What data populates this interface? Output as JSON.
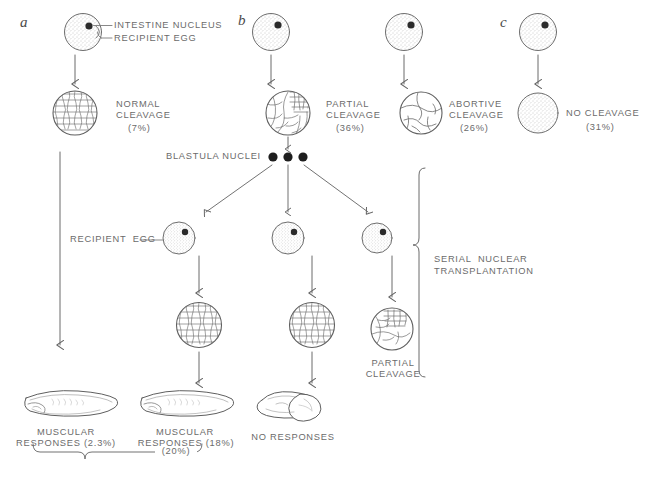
{
  "figure": {
    "background_color": "#ffffff",
    "ink_color": "#555555",
    "text_color": "#6b6b6b",
    "width": 655,
    "height": 479
  },
  "panels": [
    {
      "letter": "a"
    },
    {
      "letter": "b"
    },
    {
      "letter": "c"
    }
  ],
  "callouts": {
    "intestine_nucleus": "INTESTINE NUCLEUS",
    "recipient_egg": "RECIPIENT EGG",
    "recipient_egg_lower": "RECIPIENT  EGG",
    "blastula_nuclei": "BLASTULA NUCLEI",
    "serial_nuclear_transplantation_line1": "SERIAL  NUCLEAR",
    "serial_nuclear_transplantation_line2": "TRANSPLANTATION"
  },
  "top_outcomes": [
    {
      "id": "normal-cleavage",
      "line1": "NORMAL",
      "line2": "CLEAVAGE",
      "percent": "(7%)",
      "morphology": "blastula-fine"
    },
    {
      "id": "partial-cleavage",
      "line1": "PARTIAL",
      "line2": "CLEAVAGE",
      "percent": "(36%)",
      "morphology": "partial-blastula"
    },
    {
      "id": "abortive-cleavage",
      "line1": "ABORTIVE",
      "line2": "CLEAVAGE",
      "percent": "(26%)",
      "morphology": "abortive"
    },
    {
      "id": "no-cleavage",
      "line1": "NO CLEAVAGE",
      "line2": "",
      "percent": "(31%)",
      "morphology": "uncleaved-egg"
    }
  ],
  "serial_branch_outcomes": [
    {
      "id": "branch-left",
      "label_line1": "",
      "label_line2": "",
      "morphology": "blastula-fine"
    },
    {
      "id": "branch-middle",
      "label_line1": "",
      "label_line2": "",
      "morphology": "blastula-fine"
    },
    {
      "id": "branch-right",
      "label_line1": "PARTIAL",
      "label_line2": "CLEAVAGE",
      "morphology": "partial-blastula"
    }
  ],
  "bottom_results": [
    {
      "id": "result-left",
      "line1": "MUSCULAR",
      "line2": "RESPONSES (2.3%)",
      "morphology": "tadpole"
    },
    {
      "id": "result-middle",
      "line1": "MUSCULAR",
      "line2": "RESPONSES (18%)",
      "morphology": "tadpole"
    },
    {
      "id": "result-right",
      "line1": "NO RESPONSES",
      "line2": "",
      "morphology": "abortive-embryo"
    }
  ],
  "summary_bracket": {
    "percent": "(20%)"
  }
}
